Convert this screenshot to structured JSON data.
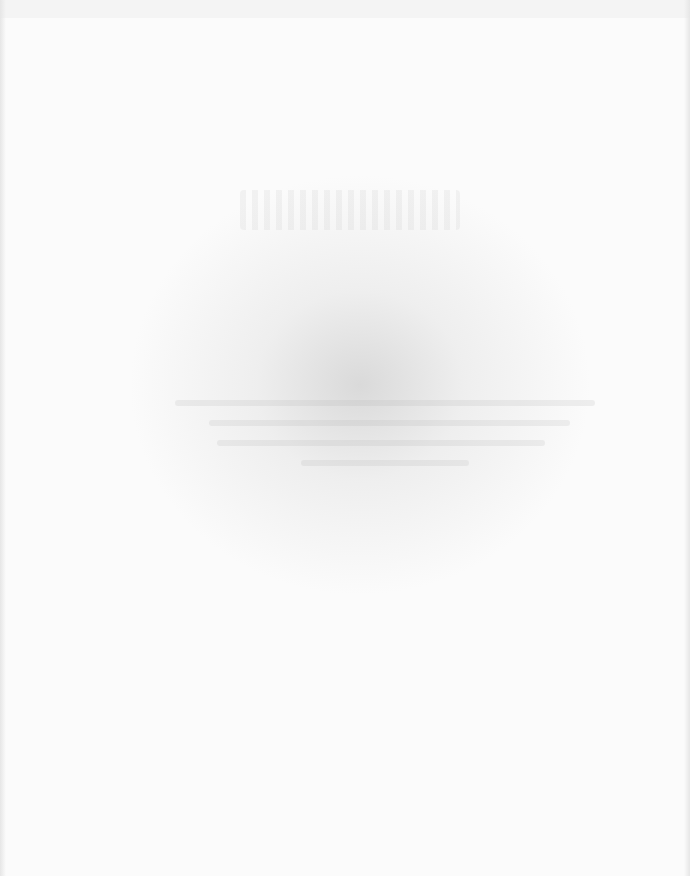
{
  "page": {
    "show_through_title": "",
    "background_color": "#fbfbfb"
  }
}
